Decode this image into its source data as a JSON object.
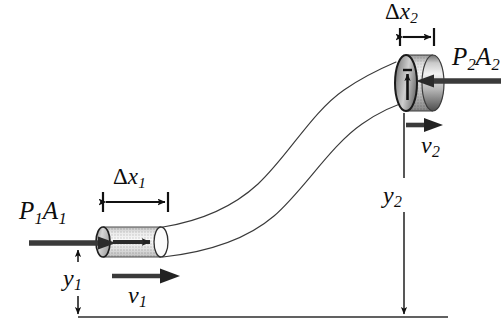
{
  "figure": {
    "background_color": "#ffffff",
    "ink_color": "#0d0d0d",
    "width": 501,
    "height": 329
  },
  "labels": {
    "pressure_force_1": {
      "symbol": "P",
      "sub": "1",
      "symbol2": "A",
      "sub2": "1",
      "text": "P₀1A₀1"
    },
    "pressure_force_2": {
      "symbol": "P",
      "sub": "2",
      "symbol2": "A",
      "sub2": "2",
      "text": "P₀2A₀2"
    },
    "displacement_1": {
      "delta": "Δ",
      "symbol": "x",
      "sub": "1",
      "text": "Δx₀1"
    },
    "displacement_2": {
      "delta": "Δ",
      "symbol": "x",
      "sub": "2",
      "text": "Δx₀2"
    },
    "height_1": {
      "symbol": "y",
      "sub": "1",
      "text": "y₀1"
    },
    "height_2": {
      "symbol": "y",
      "sub": "2",
      "text": "y₀2"
    },
    "velocity_1": {
      "symbol": "v",
      "sub": "1",
      "text": "v₀1"
    },
    "velocity_2": {
      "symbol": "v",
      "sub": "2",
      "text": "v₀2"
    }
  },
  "elements": {
    "ground_line": {
      "name": "datum-reference-line",
      "y": 317,
      "x_start": 78,
      "x_end": 448
    },
    "pipe": {
      "name": "curved-pipe-tube",
      "description": "S-shaped tube narrowing from lower-left wide section to upper-right narrow section",
      "stroke_color": "#3a3a3a",
      "stroke_width": 1.1
    },
    "cylinder_1": {
      "name": "fluid-slug-lower",
      "x_left": 100,
      "x_right": 168,
      "center_y": 242,
      "radius_y": 15,
      "radius_x": 7,
      "fill": "halftone-gray"
    },
    "cylinder_2": {
      "name": "fluid-slug-upper",
      "x_left": 395,
      "x_right": 444,
      "center_y": 83,
      "radius_y": 28,
      "radius_x": 11,
      "fill": "halftone-gray"
    }
  },
  "colors": {
    "ink": "#0d0d0d",
    "arrow_fill": "#333333",
    "pipe_stroke": "#3a3a3a",
    "cylinder_light": "#f2f2f2",
    "cylinder_mid": "#b9b9b9",
    "cylinder_dark": "#6e6e6e",
    "cylinder_darkest": "#4a4a4a"
  }
}
